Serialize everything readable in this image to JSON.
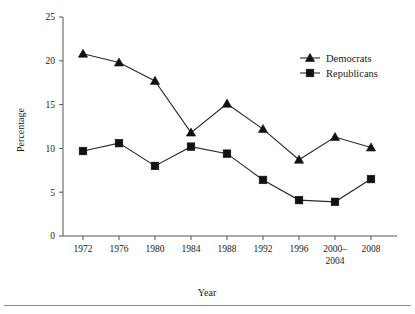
{
  "chart_data": {
    "type": "line",
    "title": "",
    "xlabel": "Year",
    "ylabel": "Percentage",
    "categories": [
      "1972",
      "1976",
      "1980",
      "1984",
      "1988",
      "1992",
      "1996",
      "2000-\n2004",
      "2008"
    ],
    "category_labels_line1": [
      "1972",
      "1976",
      "1980",
      "1984",
      "1988",
      "1992",
      "1996",
      "2000–",
      "2008"
    ],
    "category_labels_line2": [
      "",
      "",
      "",
      "",
      "",
      "",
      "",
      "2004",
      ""
    ],
    "series": [
      {
        "name": "Democrats",
        "marker": "triangle",
        "values": [
          20.8,
          19.8,
          17.7,
          11.8,
          15.1,
          12.2,
          8.7,
          11.3,
          10.1
        ]
      },
      {
        "name": "Republicans",
        "marker": "square",
        "values": [
          9.7,
          10.6,
          8.0,
          10.2,
          9.4,
          6.4,
          4.1,
          3.9,
          6.5
        ]
      }
    ],
    "ylim": [
      0,
      25
    ],
    "yticks": [
      0,
      5,
      10,
      15,
      20,
      25
    ],
    "ytick_labels": [
      "0",
      "5",
      "10",
      "15",
      "20",
      "25"
    ],
    "grid": false,
    "legend_position": "upper-right",
    "colors": {
      "line": "#2b2b2b",
      "marker": "#111111",
      "axis": "#555555",
      "text": "#1a1a1a",
      "background": "#ffffff"
    }
  }
}
